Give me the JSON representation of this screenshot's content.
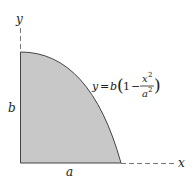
{
  "diagram": {
    "axis_x_label": "x",
    "axis_y_label": "y",
    "height_label": "b",
    "width_label": "a",
    "equation": {
      "lhs": "y",
      "eq": "=",
      "coef": "b",
      "one": "1",
      "minus": "−",
      "numerator": "x",
      "numerator_exp": "2",
      "denominator": "a",
      "denominator_exp": "2"
    },
    "colors": {
      "fill": "#c8c8c8",
      "stroke": "#444444"
    }
  }
}
